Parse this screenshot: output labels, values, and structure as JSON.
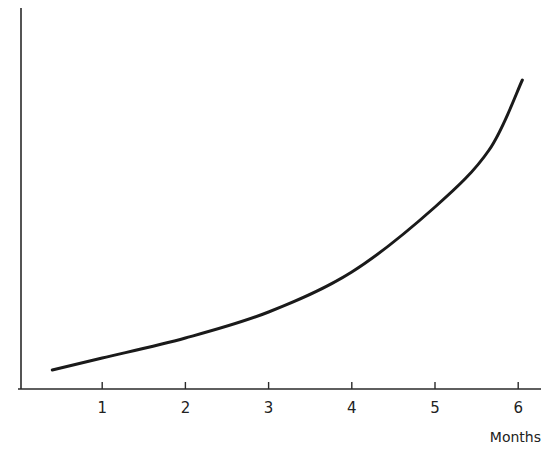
{
  "chart_data": {
    "type": "line",
    "title": "",
    "xlabel": "Months",
    "ylabel": "",
    "x_ticks": [
      "1",
      "2",
      "3",
      "4",
      "5",
      "6"
    ],
    "xlim": [
      0,
      6.3
    ],
    "y_ticks": [],
    "grid": false,
    "legend": null,
    "series": [
      {
        "name": "growth curve",
        "x": [
          0.4,
          1.0,
          2.0,
          3.0,
          4.0,
          5.0,
          5.65,
          6.05
        ],
        "y": [
          19,
          31,
          51,
          77,
          117,
          182,
          239,
          309
        ],
        "note": "y values are relative heights above x-axis in pixels; the y-axis is unlabeled"
      }
    ]
  },
  "colors": {
    "line": "#1a1a1a",
    "axis": "#2a2a2a",
    "background": "#ffffff"
  }
}
